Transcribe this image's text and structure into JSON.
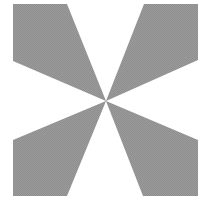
{
  "figure": {
    "type": "geometric-pattern",
    "colors": {
      "background": "#ffffff",
      "gray_fill": "#9b9b9b",
      "gray_dither": "#8e8e8e",
      "white_fill": "#ffffff"
    },
    "square": {
      "x": 13,
      "y": 4,
      "width": 185,
      "height": 192
    },
    "center": {
      "x": 106,
      "y": 101
    },
    "white_sectors": [
      {
        "name": "top",
        "points": "67,4 144,4 106,101"
      },
      {
        "name": "right",
        "points": "198,60 198,140 106,101"
      },
      {
        "name": "bottom",
        "points": "143,196 67,196 106,101"
      },
      {
        "name": "left",
        "points": "13,140 13,61 106,101"
      }
    ]
  }
}
